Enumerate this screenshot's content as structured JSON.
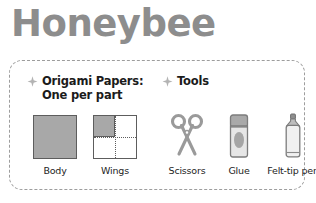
{
  "title": "Honeybee",
  "panel": {
    "sections": [
      {
        "id": "papers",
        "bullet_icon": "star-icon",
        "heading_line1": "Origami Papers:",
        "heading_line2": "One per part",
        "items": [
          {
            "label": "Body",
            "icon": "solid-paper-square-icon"
          },
          {
            "label": "Wings",
            "icon": "folded-paper-square-icon"
          }
        ]
      },
      {
        "id": "tools",
        "bullet_icon": "star-icon",
        "heading_line1": "Tools",
        "items": [
          {
            "label": "Scissors",
            "icon": "scissors-icon"
          },
          {
            "label": "Glue",
            "icon": "glue-stick-icon"
          },
          {
            "label": "Felt-tip pen",
            "icon": "felt-tip-pen-icon"
          }
        ]
      }
    ]
  },
  "colors": {
    "title_gray": "#8d8d8d",
    "paper_fill": "#a8a8a8",
    "outline": "#5d5d5d",
    "border_dash": "#9d9d9d",
    "text": "#1b1b1b"
  }
}
